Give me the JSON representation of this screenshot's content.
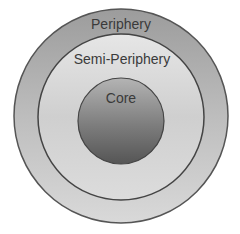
{
  "diagram": {
    "type": "concentric-circles",
    "layers": [
      {
        "id": "periphery",
        "label": "Periphery",
        "fill": "#a9a9a9"
      },
      {
        "id": "semi-periphery",
        "label": "Semi-Periphery",
        "fill": "#d4d4d4"
      },
      {
        "id": "core",
        "label": "Core",
        "fill": "#7a7a7a"
      }
    ],
    "stroke": "#4a4a4a"
  }
}
